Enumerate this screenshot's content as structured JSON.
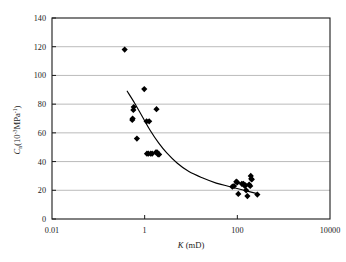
{
  "figure": {
    "ghost_text": "",
    "background_color": "#ffffff",
    "marker_color": "#000000",
    "curve_color": "#000000",
    "grid_color": "#b3b3b3",
    "axis_color": "#1a1a1a"
  },
  "axes": {
    "x": {
      "title_symbol": "K",
      "title_units": " (mD)",
      "scale": "log",
      "min": 0.01,
      "max": 10000,
      "tick_labels": [
        "0.01",
        "1",
        "100",
        "10000"
      ],
      "tick_values": [
        0.01,
        1,
        100,
        10000
      ]
    },
    "y": {
      "title_symbol": "C",
      "title_sub": "n",
      "title_units_open": "(10",
      "title_units_exp1": "-3",
      "title_units_mid": "MPa",
      "title_units_exp2": "-1",
      "title_units_close": ")",
      "scale": "linear",
      "min": 0,
      "max": 140,
      "tick_labels": [
        "0",
        "20",
        "40",
        "60",
        "80",
        "100",
        "120",
        "140"
      ],
      "tick_values": [
        0,
        20,
        40,
        60,
        80,
        100,
        120,
        140
      ],
      "grid": true
    }
  },
  "chart_data": {
    "type": "scatter",
    "title": "",
    "subtitle": "",
    "xlabel": "K (mD)",
    "ylabel": "Cn (10-3 MPa-1)",
    "xscale": "log",
    "yscale": "linear",
    "xlim": [
      0.01,
      10000
    ],
    "ylim": [
      0,
      140
    ],
    "grid": true,
    "legend": "none",
    "xticks": [
      0.01,
      1,
      100,
      10000
    ],
    "yticks": [
      0,
      20,
      40,
      60,
      80,
      100,
      120,
      140
    ],
    "series": [
      {
        "name": "measurements",
        "marker": "diamond",
        "color": "#000000",
        "points": [
          {
            "x": 0.37,
            "y": 118
          },
          {
            "x": 0.58,
            "y": 78
          },
          {
            "x": 0.57,
            "y": 76
          },
          {
            "x": 0.55,
            "y": 70
          },
          {
            "x": 0.54,
            "y": 69
          },
          {
            "x": 0.68,
            "y": 56
          },
          {
            "x": 0.98,
            "y": 90.5
          },
          {
            "x": 1.1,
            "y": 68
          },
          {
            "x": 1.25,
            "y": 68
          },
          {
            "x": 1.8,
            "y": 76.5
          },
          {
            "x": 1.12,
            "y": 45.5
          },
          {
            "x": 1.2,
            "y": 45.5
          },
          {
            "x": 1.35,
            "y": 45.5
          },
          {
            "x": 1.45,
            "y": 45.5
          },
          {
            "x": 1.75,
            "y": 46.5
          },
          {
            "x": 1.85,
            "y": 46.5
          },
          {
            "x": 1.95,
            "y": 45
          },
          {
            "x": 2.05,
            "y": 45
          },
          {
            "x": 78,
            "y": 22.5
          },
          {
            "x": 85,
            "y": 23
          },
          {
            "x": 95,
            "y": 26
          },
          {
            "x": 100,
            "y": 25.5
          },
          {
            "x": 105,
            "y": 17.5
          },
          {
            "x": 125,
            "y": 24.5
          },
          {
            "x": 135,
            "y": 24.5
          },
          {
            "x": 145,
            "y": 23
          },
          {
            "x": 150,
            "y": 23.5
          },
          {
            "x": 155,
            "y": 20
          },
          {
            "x": 165,
            "y": 16
          },
          {
            "x": 180,
            "y": 24
          },
          {
            "x": 190,
            "y": 23
          },
          {
            "x": 195,
            "y": 30
          },
          {
            "x": 200,
            "y": 28
          },
          {
            "x": 205,
            "y": 27.5
          },
          {
            "x": 270,
            "y": 17
          }
        ]
      }
    ],
    "trend_curve": {
      "name": "fitted-trend",
      "color": "#000000",
      "points": [
        {
          "x": 0.42,
          "y": 89
        },
        {
          "x": 0.6,
          "y": 81
        },
        {
          "x": 0.9,
          "y": 71
        },
        {
          "x": 1.3,
          "y": 62
        },
        {
          "x": 2.0,
          "y": 53
        },
        {
          "x": 3.0,
          "y": 46
        },
        {
          "x": 5.0,
          "y": 39
        },
        {
          "x": 9.0,
          "y": 33
        },
        {
          "x": 18,
          "y": 28.5
        },
        {
          "x": 35,
          "y": 25
        },
        {
          "x": 70,
          "y": 22.5
        },
        {
          "x": 140,
          "y": 20
        },
        {
          "x": 280,
          "y": 17.5
        }
      ]
    }
  }
}
